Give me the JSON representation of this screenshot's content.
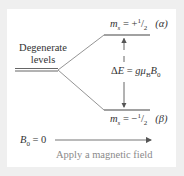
{
  "diagram": {
    "type": "energy-level-splitting",
    "degenerate_label_line1": "Degenerate",
    "degenerate_label_line2": "levels",
    "upper_level": {
      "ms_symbol": "m",
      "ms_sub": "s",
      "eq": " = +",
      "num": "1",
      "den": "2",
      "state": "(α)"
    },
    "lower_level": {
      "ms_symbol": "m",
      "ms_sub": "s",
      "eq": " = −",
      "num": "1",
      "den": "2",
      "state": "(β)"
    },
    "energy_gap": {
      "delta": "Δ",
      "E": "E",
      "eq": " = ",
      "g": "g",
      "mu": "μ",
      "mu_sub": "B",
      "B": "B",
      "B_sub": "0"
    },
    "field_zero": {
      "B": "B",
      "sub": "0",
      "eq": " = 0"
    },
    "field_caption": "Apply a magnetic field",
    "colors": {
      "background": "#efefef",
      "panel": "#ffffff",
      "lines": "#555555",
      "caption": "#8a8a8a"
    }
  }
}
